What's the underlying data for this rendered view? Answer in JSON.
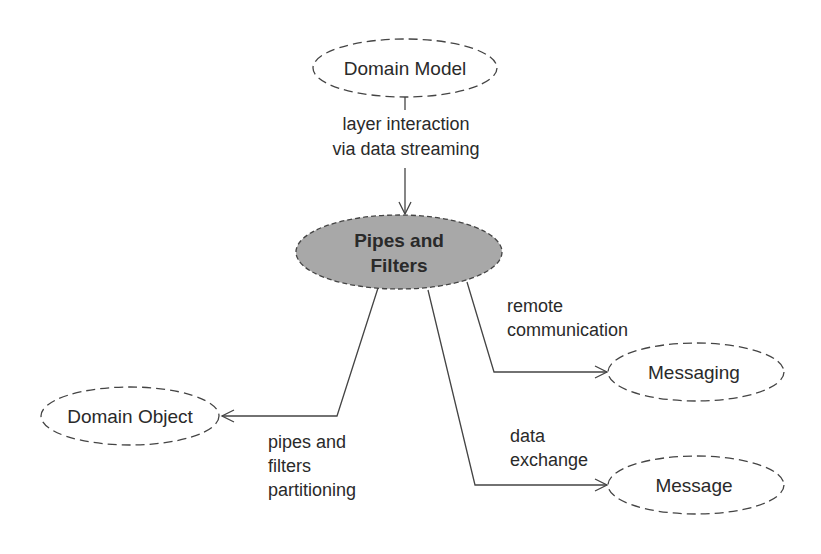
{
  "nodes": {
    "center": {
      "line1": "Pipes and",
      "line2": "Filters"
    },
    "domain_model": {
      "label": "Domain Model"
    },
    "domain_object": {
      "label": "Domain Object"
    },
    "messaging": {
      "label": "Messaging"
    },
    "message": {
      "label": "Message"
    }
  },
  "edges": {
    "domain_model_to_center": {
      "line1": "layer interaction",
      "line2": "via data streaming"
    },
    "center_to_domain_object": {
      "line1": "pipes and",
      "line2": "filters",
      "line3": "partitioning"
    },
    "center_to_messaging": {
      "line1": "remote",
      "line2": "communication"
    },
    "center_to_message": {
      "line1": "data",
      "line2": "exchange"
    }
  },
  "colors": {
    "center_fill": "#a8a8a8",
    "stroke": "#444444",
    "text": "#2a2a2a"
  }
}
